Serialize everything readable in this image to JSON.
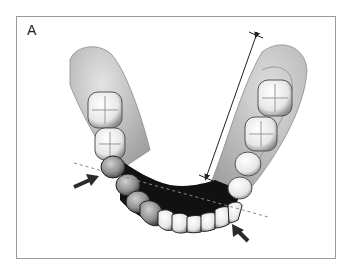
{
  "figure": {
    "panel_label": "A",
    "colors": {
      "frame_border": "#9a9a9a",
      "gum_light": "#d8d8d8",
      "gum_mid": "#a8a8a8",
      "tooth_light": "#f2f2f2",
      "tooth_shadow": "#8c8c8c",
      "dark_region": "#111111",
      "arrow": "#2a2a2a",
      "dashed_line": "#888888",
      "measure_line": "#222222"
    },
    "annotations": {
      "left_arrow": "arrow pointing to left premolar",
      "right_arrow": "arrow pointing to right canine",
      "dashed_line": "reference line across canines",
      "measurement": "double-headed length measurement along right arch"
    }
  }
}
